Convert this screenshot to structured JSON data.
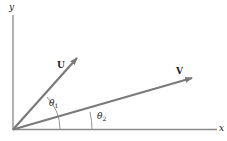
{
  "diagram": {
    "type": "vector-angle-diagram",
    "axes": {
      "x_label": "x",
      "y_label": "y"
    },
    "vectors": [
      {
        "name": "U",
        "label": "U"
      },
      {
        "name": "V",
        "label": "V"
      }
    ],
    "angles": [
      {
        "name": "theta1",
        "symbol": "θ",
        "subscript": "1",
        "between": "U and x-axis"
      },
      {
        "name": "theta2",
        "symbol": "θ",
        "subscript": "2",
        "between": "V and x-axis"
      }
    ],
    "colors": {
      "vector": "#7a7a7a",
      "axis": "#8a8a8a",
      "text": "#222222"
    }
  }
}
